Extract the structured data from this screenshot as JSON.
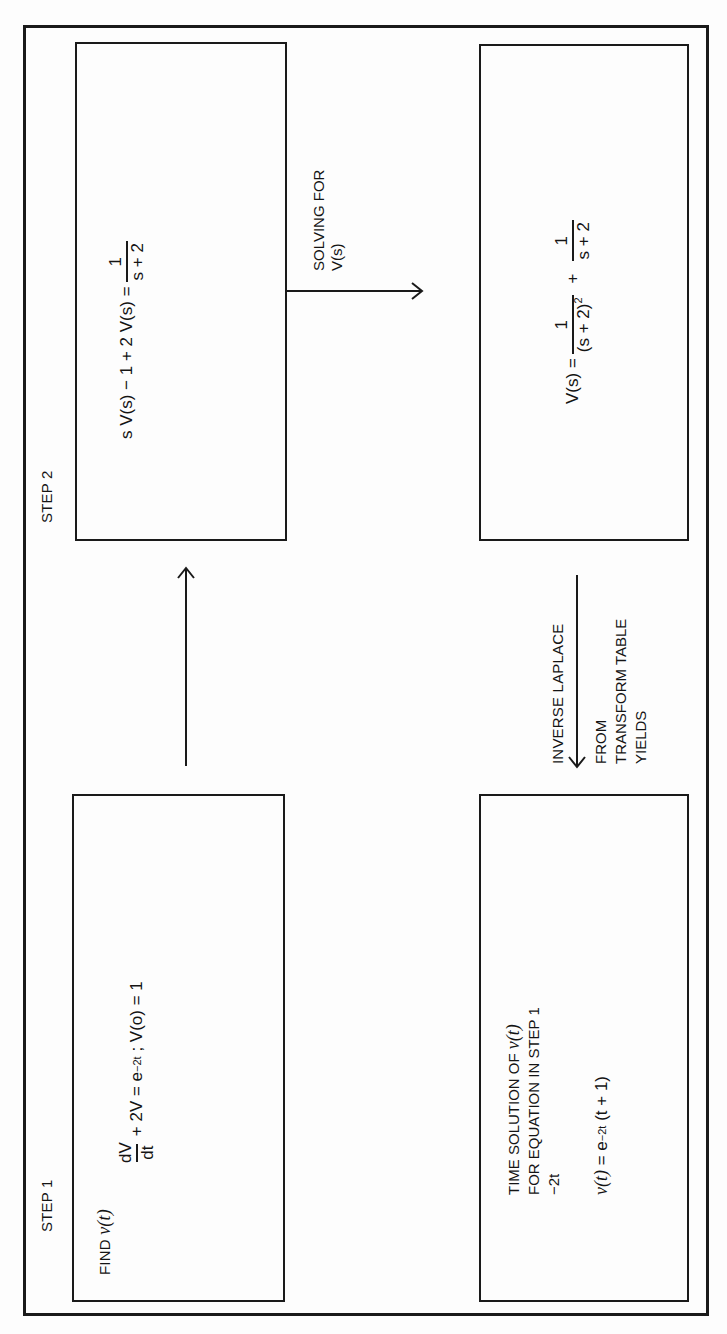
{
  "figure": {
    "orientation": "rotated 90° counter-clockwise",
    "step1_label": "STEP 1",
    "step2_label": "STEP 2"
  },
  "boxes": {
    "step1": {
      "title_prefix": "FIND ",
      "title_var": "v(t)",
      "equation": {
        "frac_num": "dV",
        "frac_den": "dt",
        "rest_a": "+ 2V = e",
        "exp": "−2t",
        "rest_b": " ; V(o) = 1"
      }
    },
    "step2": {
      "equation": {
        "lhs": "s V(s) − 1 + 2 V(s) =",
        "frac_num": "1",
        "frac_den": "s + 2"
      }
    },
    "laplace": {
      "equation": {
        "lhs": "V(s) =",
        "frac1_num": "1",
        "frac1_den": "(s + 2)",
        "frac1_den_exp": "2",
        "plus": "+",
        "frac2_num": "1",
        "frac2_den": "s + 2"
      }
    },
    "solution": {
      "line1_prefix": "TIME SOLUTION OF ",
      "line1_var": "v(t)",
      "line2": "FOR EQUATION IN STEP 1",
      "line3": "−2t",
      "result_var": "v(t)",
      "result_a": " = e",
      "result_exp": "−2t",
      "result_b": " (t + 1)"
    }
  },
  "arrows": {
    "step1_to_step2": {
      "direction": "right"
    },
    "solving": {
      "label_line1": "SOLVING FOR",
      "label_line2": "V(s)",
      "direction": "down"
    },
    "inverse_laplace": {
      "label_line1": "INVERSE LAPLACE",
      "label_line2": "FROM",
      "label_line3": "TRANSFORM TABLE",
      "label_line4": "YIELDS",
      "direction": "left"
    }
  },
  "colors": {
    "ink": "#1a1a1a",
    "paper": "#fdfdfd"
  }
}
